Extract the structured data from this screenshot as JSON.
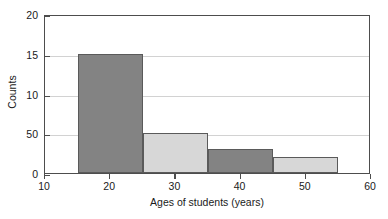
{
  "chart_data": {
    "type": "bar",
    "title": "",
    "subtitle": "",
    "xlabel": "Ages of students (years)",
    "ylabel": "Counts",
    "xlim": [
      10,
      60
    ],
    "ylim": [
      0,
      20
    ],
    "grid": true,
    "legend": null,
    "xticks": [
      {
        "value": 10,
        "label": "10"
      },
      {
        "value": 20,
        "label": "20"
      },
      {
        "value": 30,
        "label": "30"
      },
      {
        "value": 40,
        "label": "40"
      },
      {
        "value": 50,
        "label": "50"
      },
      {
        "value": 60,
        "label": "60"
      }
    ],
    "yticks": [
      {
        "value": 0,
        "label": "0"
      },
      {
        "value": 5,
        "label": "50"
      },
      {
        "value": 10,
        "label": "10"
      },
      {
        "value": 15,
        "label": "15"
      },
      {
        "value": 20,
        "label": "20"
      }
    ],
    "bins": [
      {
        "bin_start": 15,
        "bin_end": 25,
        "value": 15,
        "color": "#838383",
        "label": "15-25"
      },
      {
        "bin_start": 25,
        "bin_end": 35,
        "value": 5,
        "color": "#d7d7d7",
        "label": "25-35"
      },
      {
        "bin_start": 35,
        "bin_end": 45,
        "value": 3,
        "color": "#838383",
        "label": "35-45"
      },
      {
        "bin_start": 45,
        "bin_end": 55,
        "value": 2,
        "color": "#d7d7d7",
        "label": "45-55"
      }
    ],
    "categories": [
      "15-25",
      "25-35",
      "35-45",
      "45-55"
    ],
    "values": [
      15,
      5,
      3,
      2
    ],
    "colors": {
      "bar_dark": "#838383",
      "bar_light": "#d7d7d7",
      "bar_edge": "#5a5a5a",
      "axis": "#4d4d4d",
      "gridline": "#d2d2d2",
      "background": "#ffffff",
      "text": "#1a1a1a"
    }
  }
}
